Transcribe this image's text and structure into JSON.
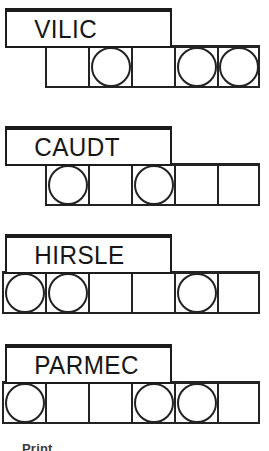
{
  "page": {
    "caption": "Print"
  },
  "colors": {
    "ink": "#232323",
    "paper": "#ffffff",
    "text": "#161616"
  },
  "groups": [
    {
      "id": "group-vilic",
      "label": "VILIC",
      "label_left": 5,
      "label_top": 8,
      "label_width": 167,
      "label_height": 40,
      "row_left": 45,
      "row_top": 45,
      "cells": [
        {
          "filled": false
        },
        {
          "filled": true
        },
        {
          "filled": false
        },
        {
          "filled": true
        },
        {
          "filled": true
        }
      ]
    },
    {
      "id": "group-caudt",
      "label": "CAUDT",
      "label_left": 5,
      "label_top": 126,
      "label_width": 167,
      "label_height": 40,
      "row_left": 45,
      "row_top": 163,
      "cells": [
        {
          "filled": true
        },
        {
          "filled": false
        },
        {
          "filled": true
        },
        {
          "filled": false
        },
        {
          "filled": false
        }
      ]
    },
    {
      "id": "group-hirsle",
      "label": "HIRSLE",
      "label_left": 5,
      "label_top": 234,
      "label_width": 167,
      "label_height": 40,
      "row_left": 2,
      "row_top": 271,
      "cells": [
        {
          "filled": true
        },
        {
          "filled": true
        },
        {
          "filled": false
        },
        {
          "filled": false
        },
        {
          "filled": true
        },
        {
          "filled": false
        }
      ]
    },
    {
      "id": "group-parmec",
      "label": "PARMEC",
      "label_left": 5,
      "label_top": 344,
      "label_width": 167,
      "label_height": 40,
      "row_left": 2,
      "row_top": 381,
      "cells": [
        {
          "filled": true
        },
        {
          "filled": false
        },
        {
          "filled": false
        },
        {
          "filled": true
        },
        {
          "filled": true
        },
        {
          "filled": false
        }
      ]
    }
  ]
}
